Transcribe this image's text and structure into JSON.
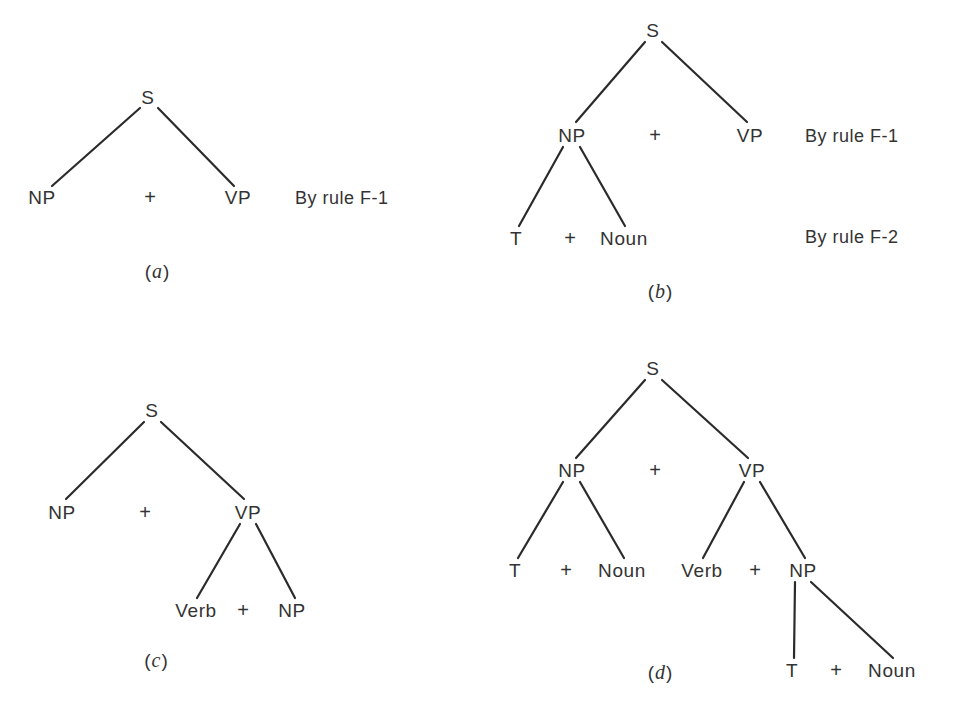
{
  "figure": {
    "background_color": "#ffffff",
    "line_color": "#2b2b2b",
    "text_color": "#333333"
  },
  "panels": [
    {
      "id": "a",
      "caption_open": "(",
      "caption_letter": "a",
      "caption_close": ")",
      "nodes": [
        {
          "label": "S",
          "x": 148,
          "y": 97
        },
        {
          "label": "NP",
          "x": 42,
          "y": 197
        },
        {
          "label": "+",
          "x": 150,
          "y": 197
        },
        {
          "label": "VP",
          "x": 238,
          "y": 197
        }
      ],
      "edges": [
        {
          "x1": 140,
          "y1": 108,
          "x2": 52,
          "y2": 186
        },
        {
          "x1": 158,
          "y1": 108,
          "x2": 234,
          "y2": 186
        }
      ],
      "notes": [
        {
          "text": "By rule F-1",
          "x": 295,
          "y": 198
        }
      ],
      "caption_x": 157,
      "caption_y": 271
    },
    {
      "id": "b",
      "caption_open": "(",
      "caption_letter": "b",
      "caption_close": ")",
      "nodes": [
        {
          "label": "S",
          "x": 653,
          "y": 30
        },
        {
          "label": "NP",
          "x": 572,
          "y": 135
        },
        {
          "label": "+",
          "x": 655,
          "y": 135
        },
        {
          "label": "VP",
          "x": 750,
          "y": 135
        },
        {
          "label": "T",
          "x": 516,
          "y": 238
        },
        {
          "label": "+",
          "x": 570,
          "y": 238
        },
        {
          "label": "Noun",
          "x": 624,
          "y": 238
        }
      ],
      "edges": [
        {
          "x1": 645,
          "y1": 42,
          "x2": 576,
          "y2": 122
        },
        {
          "x1": 662,
          "y1": 42,
          "x2": 747,
          "y2": 122
        },
        {
          "x1": 563,
          "y1": 147,
          "x2": 519,
          "y2": 226
        },
        {
          "x1": 580,
          "y1": 147,
          "x2": 625,
          "y2": 226
        }
      ],
      "notes": [
        {
          "text": "By rule F-1",
          "x": 805,
          "y": 136
        },
        {
          "text": "By rule F-2",
          "x": 805,
          "y": 237
        }
      ],
      "caption_x": 660,
      "caption_y": 291
    },
    {
      "id": "c",
      "caption_open": "(",
      "caption_letter": "c",
      "caption_close": ")",
      "nodes": [
        {
          "label": "S",
          "x": 152,
          "y": 410
        },
        {
          "label": "NP",
          "x": 62,
          "y": 512
        },
        {
          "label": "+",
          "x": 145,
          "y": 512
        },
        {
          "label": "VP",
          "x": 248,
          "y": 512
        },
        {
          "label": "Verb",
          "x": 196,
          "y": 610
        },
        {
          "label": "+",
          "x": 243,
          "y": 610
        },
        {
          "label": "NP",
          "x": 292,
          "y": 610
        }
      ],
      "edges": [
        {
          "x1": 144,
          "y1": 422,
          "x2": 66,
          "y2": 499
        },
        {
          "x1": 161,
          "y1": 422,
          "x2": 244,
          "y2": 499
        },
        {
          "x1": 240,
          "y1": 524,
          "x2": 197,
          "y2": 598
        },
        {
          "x1": 256,
          "y1": 524,
          "x2": 295,
          "y2": 598
        }
      ],
      "notes": [],
      "caption_x": 156,
      "caption_y": 660
    },
    {
      "id": "d",
      "caption_open": "(",
      "caption_letter": "d",
      "caption_close": ")",
      "nodes": [
        {
          "label": "S",
          "x": 653,
          "y": 368
        },
        {
          "label": "NP",
          "x": 572,
          "y": 470
        },
        {
          "label": "+",
          "x": 655,
          "y": 470
        },
        {
          "label": "VP",
          "x": 752,
          "y": 470
        },
        {
          "label": "T",
          "x": 515,
          "y": 570
        },
        {
          "label": "+",
          "x": 566,
          "y": 570
        },
        {
          "label": "Noun",
          "x": 622,
          "y": 570
        },
        {
          "label": "Verb",
          "x": 702,
          "y": 570
        },
        {
          "label": "+",
          "x": 755,
          "y": 570
        },
        {
          "label": "NP",
          "x": 803,
          "y": 570
        },
        {
          "label": "T",
          "x": 792,
          "y": 670
        },
        {
          "label": "+",
          "x": 836,
          "y": 670
        },
        {
          "label": "Noun",
          "x": 892,
          "y": 670
        }
      ],
      "edges": [
        {
          "x1": 645,
          "y1": 380,
          "x2": 576,
          "y2": 458
        },
        {
          "x1": 662,
          "y1": 380,
          "x2": 748,
          "y2": 458
        },
        {
          "x1": 563,
          "y1": 482,
          "x2": 518,
          "y2": 558
        },
        {
          "x1": 580,
          "y1": 482,
          "x2": 624,
          "y2": 558
        },
        {
          "x1": 744,
          "y1": 482,
          "x2": 703,
          "y2": 558
        },
        {
          "x1": 760,
          "y1": 482,
          "x2": 805,
          "y2": 558
        },
        {
          "x1": 795,
          "y1": 582,
          "x2": 794,
          "y2": 658
        },
        {
          "x1": 811,
          "y1": 582,
          "x2": 893,
          "y2": 658
        }
      ],
      "notes": [],
      "caption_x": 660,
      "caption_y": 672
    }
  ]
}
